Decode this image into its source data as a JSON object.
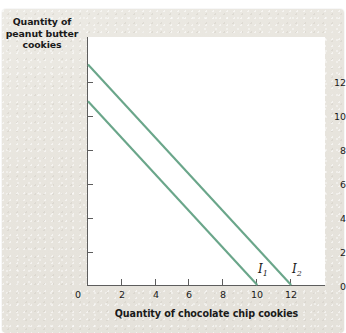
{
  "chart_data": {
    "type": "line",
    "title": "",
    "xlabel": "Quantity of chocolate chip cookies",
    "ylabel": "Quantity of peanut butter cookies",
    "xlim": [
      0,
      14
    ],
    "ylim": [
      0,
      13.5
    ],
    "grid": false,
    "legend": "inline-end-labels",
    "x_ticks": [
      {
        "value": 0,
        "label": "0"
      },
      {
        "value": 2,
        "label": "2"
      },
      {
        "value": 4,
        "label": "4"
      },
      {
        "value": 6,
        "label": "6"
      },
      {
        "value": 8,
        "label": "8"
      },
      {
        "value": 10,
        "label": "10"
      },
      {
        "value": 12,
        "label": "12"
      }
    ],
    "y_ticks": [
      {
        "value": 0,
        "label": "0"
      },
      {
        "value": 2,
        "label": "2"
      },
      {
        "value": 4,
        "label": "4"
      },
      {
        "value": 6,
        "label": "6"
      },
      {
        "value": 8,
        "label": "8"
      },
      {
        "value": 10,
        "label": "10"
      },
      {
        "value": 12,
        "label": "12"
      }
    ],
    "line_color": "#6aa68a",
    "series": [
      {
        "name": "I1",
        "label_text": "I",
        "label_sub": "1",
        "x": [
          0,
          10
        ],
        "y": [
          10,
          0
        ],
        "x_intercept": 10,
        "y_intercept": 10,
        "slope": -1
      },
      {
        "name": "I2",
        "label_text": "I",
        "label_sub": "2",
        "x": [
          0,
          12
        ],
        "y": [
          12,
          0
        ],
        "x_intercept": 12,
        "y_intercept": 12,
        "slope": -1
      }
    ]
  },
  "axis": {
    "y_title": "Quantity of peanut butter cookies",
    "x_title": "Quantity of chocolate chip cookies"
  },
  "ticks": {
    "y": [
      "12",
      "10",
      "8",
      "6",
      "4",
      "2",
      "0"
    ],
    "x": [
      "0",
      "2",
      "4",
      "6",
      "8",
      "10",
      "12"
    ]
  },
  "curves": {
    "i1": {
      "letter": "I",
      "sub": "1"
    },
    "i2": {
      "letter": "I",
      "sub": "2"
    }
  },
  "colors": {
    "line": "#6aa68a",
    "axis": "#5d5d5d",
    "panel": "#ffffff",
    "card": "#e8e5de",
    "text": "#1a1a1a"
  }
}
